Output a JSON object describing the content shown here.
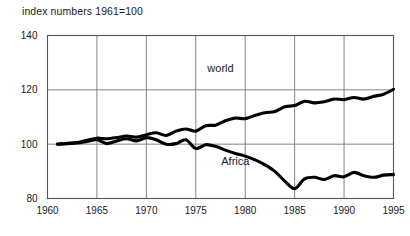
{
  "chart_data": {
    "type": "line",
    "title": "index numbers 1961=100",
    "xlabel": "",
    "ylabel": "",
    "xlim": [
      1960,
      1995
    ],
    "ylim": [
      80,
      140
    ],
    "yticks": [
      80,
      100,
      120,
      140
    ],
    "xticks": [
      1960,
      1965,
      1970,
      1975,
      1980,
      1985,
      1990,
      1995
    ],
    "grid": true,
    "legend_position": "inline-annotation",
    "annotations": [
      {
        "text": "world",
        "x": 1977.5,
        "y": 126.5
      },
      {
        "text": "Africa",
        "x": 1979.0,
        "y": 92.5
      }
    ],
    "series": [
      {
        "name": "world",
        "label": "world",
        "color": "#000000",
        "x": [
          1961,
          1962,
          1963,
          1964,
          1965,
          1966,
          1967,
          1968,
          1969,
          1970,
          1971,
          1972,
          1973,
          1974,
          1975,
          1976,
          1977,
          1978,
          1979,
          1980,
          1981,
          1982,
          1983,
          1984,
          1985,
          1986,
          1987,
          1988,
          1989,
          1990,
          1991,
          1992,
          1993,
          1994,
          1995
        ],
        "values": [
          100,
          100.3,
          100.6,
          101.4,
          102.2,
          102.0,
          102.4,
          103.0,
          102.6,
          103.5,
          104.2,
          103.2,
          104.8,
          105.6,
          104.8,
          106.8,
          107.0,
          108.6,
          109.6,
          109.4,
          110.6,
          111.6,
          112.0,
          113.8,
          114.2,
          115.8,
          115.2,
          115.6,
          116.6,
          116.4,
          117.2,
          116.6,
          117.6,
          118.4,
          120.2
        ]
      },
      {
        "name": "Africa",
        "label": "Africa",
        "color": "#000000",
        "x": [
          1961,
          1962,
          1963,
          1964,
          1965,
          1966,
          1967,
          1968,
          1969,
          1970,
          1971,
          1972,
          1973,
          1974,
          1975,
          1976,
          1977,
          1978,
          1979,
          1980,
          1981,
          1982,
          1983,
          1984,
          1985,
          1986,
          1987,
          1988,
          1989,
          1990,
          1991,
          1992,
          1993,
          1994,
          1995
        ],
        "values": [
          100,
          100.2,
          100.4,
          101.0,
          101.6,
          100.2,
          101.2,
          102.0,
          101.2,
          102.4,
          101.6,
          100.0,
          100.2,
          101.6,
          98.4,
          99.8,
          99.2,
          97.8,
          96.6,
          95.6,
          94.2,
          92.4,
          90.0,
          86.4,
          83.6,
          87.2,
          87.8,
          87.0,
          88.4,
          88.0,
          89.6,
          88.4,
          87.8,
          88.6,
          88.8
        ]
      }
    ]
  }
}
